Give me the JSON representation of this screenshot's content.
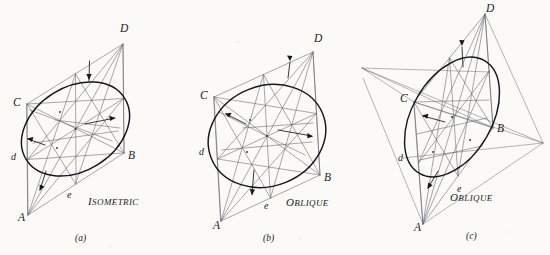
{
  "page": {
    "background_color": "#fbfaf7",
    "ink_color": "#15171a",
    "construction_line_color": "#5d6066",
    "width": 550,
    "height": 255
  },
  "figures": [
    {
      "id": "a",
      "caption": "ISOMETRIC",
      "caption_first_letter": "I",
      "caption_rest": "SOMETRIC",
      "fignum": "(a)",
      "vertices": [
        {
          "name": "A",
          "label": "A",
          "x": 22,
          "y": 217
        },
        {
          "name": "B",
          "label": "B",
          "x": 128,
          "y": 155
        },
        {
          "name": "C",
          "label": "C",
          "x": 21,
          "y": 102
        },
        {
          "name": "D",
          "label": "D",
          "x": 120,
          "y": 42
        },
        {
          "name": "d",
          "label": "d",
          "x": 17,
          "y": 157
        },
        {
          "name": "e",
          "label": "e",
          "x": 72,
          "y": 194
        }
      ]
    },
    {
      "id": "b",
      "caption": "OBLIQUE",
      "caption_first_letter": "O",
      "caption_rest": "BLIQUE",
      "fignum": "(b)",
      "vertices": [
        {
          "name": "A",
          "label": "A",
          "x": 215,
          "y": 223
        },
        {
          "name": "B",
          "label": "B",
          "x": 325,
          "y": 177
        },
        {
          "name": "C",
          "label": "C",
          "x": 208,
          "y": 95
        },
        {
          "name": "D",
          "label": "D",
          "x": 318,
          "y": 51
        },
        {
          "name": "d",
          "label": "d",
          "x": 205,
          "y": 152
        },
        {
          "name": "e",
          "label": "e",
          "x": 268,
          "y": 206
        }
      ]
    },
    {
      "id": "c",
      "caption": "OBLIQUE",
      "caption_first_letter": "O",
      "caption_rest": "BLIQUE",
      "fignum": "(c)",
      "vertices": [
        {
          "name": "A",
          "label": "A",
          "x": 417,
          "y": 226
        },
        {
          "name": "B",
          "label": "B",
          "x": 498,
          "y": 130
        },
        {
          "name": "C",
          "label": "C",
          "x": 408,
          "y": 100
        },
        {
          "name": "D",
          "label": "D",
          "x": 490,
          "y": 12
        },
        {
          "name": "d",
          "label": "d",
          "x": 403,
          "y": 158
        },
        {
          "name": "e",
          "label": "e",
          "x": 460,
          "y": 189
        }
      ]
    }
  ],
  "annotations": {
    "arrow_count_per_figure": 4,
    "arrow_meaning": "radius-direction tick arrows on the inscribed ellipse"
  }
}
